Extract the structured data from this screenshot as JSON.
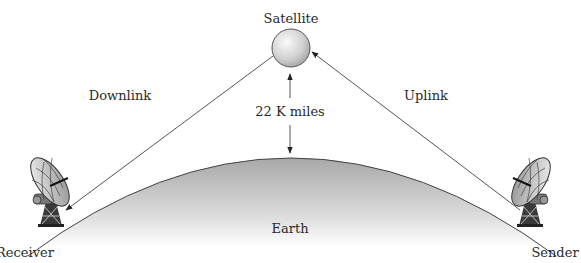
{
  "labels": {
    "satellite": "Satellite",
    "downlink": "Downlink",
    "uplink": "Uplink",
    "distance": "22 K miles",
    "earth": "Earth",
    "receiver": "Receiver",
    "sender": "Sender"
  },
  "nodes": [
    {
      "id": "receiver",
      "label": "Receiver",
      "icon": "satellite-dish-icon"
    },
    {
      "id": "satellite",
      "label": "Satellite",
      "icon": "satellite-sphere-icon"
    },
    {
      "id": "sender",
      "label": "Sender",
      "icon": "satellite-dish-icon"
    }
  ],
  "edges": [
    {
      "from": "sender",
      "to": "satellite",
      "label": "Uplink"
    },
    {
      "from": "satellite",
      "to": "receiver",
      "label": "Downlink"
    }
  ],
  "dimension": {
    "between": [
      "satellite",
      "earth"
    ],
    "label": "22 K miles"
  },
  "colors": {
    "line": "#555555",
    "earth_top": "#a9a9a9",
    "earth_bottom": "#ffffff",
    "satellite_light": "#f4f4f4",
    "satellite_dark": "#9a9a9a",
    "text": "#2a2a2a"
  }
}
